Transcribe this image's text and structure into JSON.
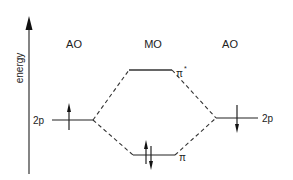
{
  "diagram": {
    "axis_label": "energy",
    "column_labels": {
      "left": "AO",
      "middle": "MO",
      "right": "AO"
    },
    "levels": {
      "left_ao": {
        "label": "2p",
        "electrons": "up"
      },
      "right_ao": {
        "label": "2p",
        "electrons": "down"
      },
      "antibonding": {
        "label": "π",
        "superscript": "*",
        "electrons": "none"
      },
      "bonding": {
        "label": "π",
        "electrons": "up-down pair"
      }
    },
    "colors": {
      "line": "#333333",
      "axis": "#555555",
      "text": "#222222"
    }
  }
}
